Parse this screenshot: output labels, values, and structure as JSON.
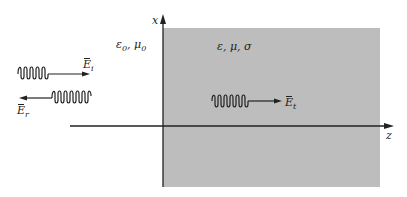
{
  "diagram": {
    "regions": [
      {
        "id": "free-space",
        "label": "ε0, μ0",
        "label_main": "ε",
        "label_sub1": "0",
        "label_mid": ", μ",
        "label_sub2": "0",
        "fill": "#ffffff"
      },
      {
        "id": "conducting-medium",
        "label": "ε, μ, σ",
        "fill": "#bdbdbd"
      }
    ],
    "axes": {
      "vertical": {
        "label": "x"
      },
      "horizontal": {
        "label": "z"
      }
    },
    "waves": {
      "incident": {
        "symbol": "E",
        "subscript": "i",
        "direction": "right"
      },
      "reflected": {
        "symbol": "E",
        "subscript": "r",
        "direction": "left"
      },
      "transmitted": {
        "symbol": "E",
        "subscript": "t",
        "direction": "right"
      }
    },
    "colors": {
      "line": "#222222",
      "medium": "#bdbdbd"
    }
  }
}
